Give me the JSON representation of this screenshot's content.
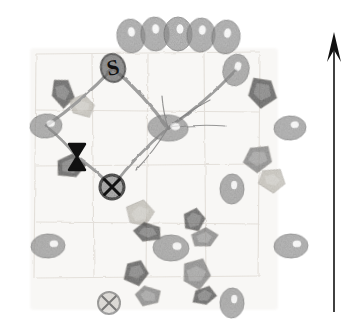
{
  "figure": {
    "background_color": "#ffffff",
    "width": 358,
    "height": 332,
    "paper_tint": "#f7f6f4",
    "grid_line_color": "#ded9d2",
    "node_fill": "#8d8d8d",
    "node_stroke": "#6d6d6d",
    "node_highlight": "#ffffff",
    "flake_dark": "#3a3a3a",
    "flake_mid": "#6f6f6f",
    "flake_light": "#b9b5ad",
    "link_color": "#9a9a9a",
    "thin_link_color": "#7d7d7d",
    "symbol_color": "#111111"
  },
  "north_arrow": {
    "name": "north-arrow",
    "label": "",
    "x": 334,
    "y_top": 32,
    "y_bottom": 312,
    "color": "#111111",
    "shaft_width": 1.6,
    "head_length": 30,
    "head_half_width": 7
  },
  "grid": {
    "visible": true,
    "cell_size": 56,
    "origin_x": 36,
    "origin_y": 54,
    "cols": 4,
    "rows": 4,
    "color": "#ddd8d1",
    "opacity": 0.75
  },
  "symbols": [
    {
      "name": "node-label-s",
      "glyph": "S",
      "x": 113,
      "y": 68,
      "rx": 12,
      "ry": 14,
      "font_size": 22,
      "kind": "labelled-node",
      "rotation": -12
    },
    {
      "name": "hourglass-marker",
      "glyph": "bowtie",
      "x": 77,
      "y": 157,
      "w": 16,
      "h": 26,
      "kind": "hourglass"
    },
    {
      "name": "circled-x-marker-main",
      "glyph": "circled-x",
      "x": 112,
      "y": 187,
      "r": 12,
      "kind": "circled-x",
      "weight": "heavy"
    },
    {
      "name": "circled-x-marker-lower",
      "glyph": "circled-x",
      "x": 109,
      "y": 303,
      "r": 11,
      "kind": "circled-x",
      "weight": "light"
    }
  ],
  "nodes": [
    {
      "name": "node-arc-1",
      "x": 131,
      "y": 36,
      "rx": 14,
      "ry": 17,
      "rot": -8,
      "hl_dx": 1,
      "hl_dy": -4
    },
    {
      "name": "node-arc-2",
      "x": 155,
      "y": 34,
      "rx": 14,
      "ry": 17,
      "rot": -4,
      "hl_dx": 1,
      "hl_dy": -5
    },
    {
      "name": "node-arc-3",
      "x": 178,
      "y": 34,
      "rx": 14,
      "ry": 17,
      "rot": 0,
      "hl_dx": 2,
      "hl_dy": -5
    },
    {
      "name": "node-arc-4",
      "x": 201,
      "y": 35,
      "rx": 14,
      "ry": 17,
      "rot": 4,
      "hl_dx": 1,
      "hl_dy": -5
    },
    {
      "name": "node-arc-5",
      "x": 226,
      "y": 37,
      "rx": 14,
      "ry": 17,
      "rot": 8,
      "hl_dx": 1,
      "hl_dy": -4
    },
    {
      "name": "node-arc-6",
      "x": 236,
      "y": 70,
      "rx": 13,
      "ry": 16,
      "rot": 14,
      "hl_dx": 1,
      "hl_dy": -4
    },
    {
      "name": "node-left-upper",
      "x": 46,
      "y": 126,
      "rx": 16,
      "ry": 12,
      "rot": -6,
      "hl_dx": 5,
      "hl_dy": -2
    },
    {
      "name": "node-centre-hub",
      "x": 168,
      "y": 128,
      "rx": 20,
      "ry": 13,
      "rot": 4,
      "hl_dx": 7,
      "hl_dy": -2
    },
    {
      "name": "node-right-upper",
      "x": 290,
      "y": 128,
      "rx": 16,
      "ry": 12,
      "rot": -4,
      "hl_dx": 5,
      "hl_dy": -3
    },
    {
      "name": "node-mid-right",
      "x": 232,
      "y": 189,
      "rx": 12,
      "ry": 15,
      "rot": 2,
      "hl_dx": 2,
      "hl_dy": -4
    },
    {
      "name": "node-left-lower",
      "x": 48,
      "y": 246,
      "rx": 17,
      "ry": 12,
      "rot": -3,
      "hl_dx": 6,
      "hl_dy": -2
    },
    {
      "name": "node-centre-lower",
      "x": 171,
      "y": 248,
      "rx": 18,
      "ry": 13,
      "rot": 2,
      "hl_dx": 6,
      "hl_dy": -2
    },
    {
      "name": "node-right-lower",
      "x": 291,
      "y": 246,
      "rx": 17,
      "ry": 12,
      "rot": -2,
      "hl_dx": 6,
      "hl_dy": -2
    },
    {
      "name": "node-bottom-right",
      "x": 232,
      "y": 303,
      "rx": 12,
      "ry": 15,
      "rot": 3,
      "hl_dx": 2,
      "hl_dy": -4
    }
  ],
  "links": [
    {
      "name": "link-s-to-left",
      "from": "node-label-s",
      "to": "node-left-upper",
      "width": 3.2,
      "style": "thick"
    },
    {
      "name": "link-s-to-hub",
      "from": "node-label-s",
      "to": "node-centre-hub",
      "width": 3.2,
      "style": "thick"
    },
    {
      "name": "link-arc6-to-hub",
      "from": "node-arc-6",
      "to": "node-centre-hub",
      "width": 3.0,
      "style": "thick"
    },
    {
      "name": "link-left-to-hourglass",
      "from": "node-left-upper",
      "to": "hourglass-marker",
      "width": 2.8,
      "style": "thick"
    },
    {
      "name": "link-hourglass-to-circledx",
      "from": "hourglass-marker",
      "to": "circled-x-marker-main",
      "width": 2.8,
      "style": "thick"
    },
    {
      "name": "link-circledx-to-hub",
      "from": "circled-x-marker-main",
      "to": "node-centre-hub",
      "width": 2.8,
      "style": "thick"
    },
    {
      "name": "link-hub-spoke-east",
      "from": "node-centre-hub",
      "to": "spoke-east",
      "width": 1.2,
      "style": "thin"
    },
    {
      "name": "link-hub-spoke-ne",
      "from": "node-centre-hub",
      "to": "spoke-ne",
      "width": 1.2,
      "style": "thin"
    },
    {
      "name": "link-hub-spoke-n",
      "from": "node-centre-hub",
      "to": "spoke-n",
      "width": 1.2,
      "style": "thin"
    },
    {
      "name": "link-hub-spoke-sw",
      "from": "node-centre-hub",
      "to": "spoke-sw",
      "width": 1.2,
      "style": "thin"
    }
  ],
  "flakes": [
    {
      "name": "flake-nw-1",
      "x": 62,
      "y": 92,
      "w": 26,
      "h": 34,
      "rot": -18,
      "tone": "dark"
    },
    {
      "name": "flake-nw-2",
      "x": 82,
      "y": 106,
      "w": 30,
      "h": 24,
      "rot": 12,
      "tone": "light"
    },
    {
      "name": "flake-w-1",
      "x": 70,
      "y": 166,
      "w": 34,
      "h": 28,
      "rot": -4,
      "tone": "dark"
    },
    {
      "name": "flake-ne-1",
      "x": 262,
      "y": 92,
      "w": 34,
      "h": 36,
      "rot": 8,
      "tone": "dark"
    },
    {
      "name": "flake-e-1",
      "x": 258,
      "y": 158,
      "w": 34,
      "h": 30,
      "rot": -12,
      "tone": "mid"
    },
    {
      "name": "flake-e-2",
      "x": 272,
      "y": 180,
      "w": 32,
      "h": 26,
      "rot": 16,
      "tone": "light"
    },
    {
      "name": "flake-sc-1",
      "x": 140,
      "y": 214,
      "w": 32,
      "h": 30,
      "rot": -24,
      "tone": "light"
    },
    {
      "name": "flake-sc-2",
      "x": 148,
      "y": 232,
      "w": 32,
      "h": 22,
      "rot": 6,
      "tone": "dark"
    },
    {
      "name": "flake-sc-3",
      "x": 194,
      "y": 220,
      "w": 28,
      "h": 30,
      "rot": 14,
      "tone": "dark"
    },
    {
      "name": "flake-sc-4",
      "x": 204,
      "y": 238,
      "w": 30,
      "h": 22,
      "rot": -10,
      "tone": "mid"
    },
    {
      "name": "flake-sw-1",
      "x": 136,
      "y": 272,
      "w": 28,
      "h": 30,
      "rot": -8,
      "tone": "dark"
    },
    {
      "name": "flake-sw-2",
      "x": 148,
      "y": 296,
      "w": 30,
      "h": 22,
      "rot": 10,
      "tone": "mid"
    },
    {
      "name": "flake-se-1",
      "x": 196,
      "y": 274,
      "w": 34,
      "h": 34,
      "rot": 6,
      "tone": "mid"
    },
    {
      "name": "flake-se-2",
      "x": 204,
      "y": 296,
      "w": 28,
      "h": 22,
      "rot": -14,
      "tone": "dark"
    }
  ]
}
